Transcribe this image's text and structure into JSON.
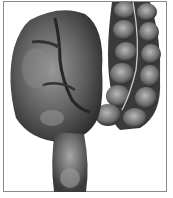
{
  "figure": {
    "alt": "Colon volvulus illustration",
    "palette": {
      "background": "#ffffff",
      "frame": "#8a8a8a",
      "tissue_dark": "#2e2e2e",
      "tissue_mid": "#6b6b6b",
      "tissue_light": "#b5b5b5"
    }
  }
}
